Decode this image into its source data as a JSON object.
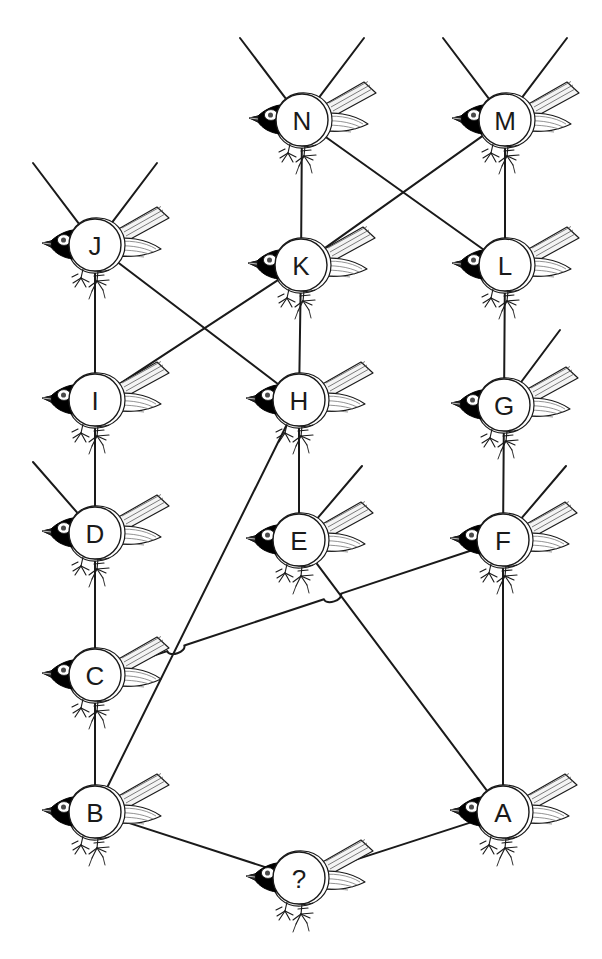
{
  "diagram": {
    "background_color": "#ffffff",
    "line_color": "#1a1a1a",
    "node_fill": "#ffffff",
    "node_stroke": "#1a1a1a",
    "label_color": "#1a1a1a",
    "bird_body_fill": "#ffffff",
    "bird_head_fill": "#000000",
    "bird_feather_fill": "#f2f2f2",
    "bird_outline": "#1a1a1a",
    "node_radius": 26
  },
  "nodes": [
    {
      "id": "N",
      "label": "N",
      "x": 302,
      "y": 120
    },
    {
      "id": "M",
      "label": "M",
      "x": 505,
      "y": 120
    },
    {
      "id": "J",
      "label": "J",
      "x": 95,
      "y": 245
    },
    {
      "id": "K",
      "label": "K",
      "x": 301,
      "y": 265
    },
    {
      "id": "L",
      "label": "L",
      "x": 505,
      "y": 265
    },
    {
      "id": "I",
      "label": "I",
      "x": 95,
      "y": 400
    },
    {
      "id": "H",
      "label": "H",
      "x": 299,
      "y": 400
    },
    {
      "id": "G",
      "label": "G",
      "x": 504,
      "y": 405
    },
    {
      "id": "D",
      "label": "D",
      "x": 95,
      "y": 533
    },
    {
      "id": "E",
      "label": "E",
      "x": 299,
      "y": 540
    },
    {
      "id": "F",
      "label": "F",
      "x": 503,
      "y": 540
    },
    {
      "id": "C",
      "label": "C",
      "x": 95,
      "y": 675
    },
    {
      "id": "B",
      "label": "B",
      "x": 95,
      "y": 812
    },
    {
      "id": "A",
      "label": "A",
      "x": 503,
      "y": 812
    },
    {
      "id": "Q",
      "label": "?",
      "x": 299,
      "y": 878
    }
  ],
  "edges": [
    {
      "from": "N",
      "to": "K",
      "kind": "straight"
    },
    {
      "from": "M",
      "to": "L",
      "kind": "straight"
    },
    {
      "from": "N",
      "to": "L",
      "kind": "straight"
    },
    {
      "from": "M",
      "to": "K",
      "kind": "straight"
    },
    {
      "from": "J",
      "to": "I",
      "kind": "straight"
    },
    {
      "from": "J",
      "to": "H",
      "kind": "straight"
    },
    {
      "from": "K",
      "to": "I",
      "kind": "straight"
    },
    {
      "from": "K",
      "to": "H",
      "kind": "straight"
    },
    {
      "from": "L",
      "to": "G",
      "kind": "straight"
    },
    {
      "from": "I",
      "to": "D",
      "kind": "straight"
    },
    {
      "from": "H",
      "to": "E",
      "kind": "straight"
    },
    {
      "from": "G",
      "to": "F",
      "kind": "straight"
    },
    {
      "from": "D",
      "to": "C",
      "kind": "straight"
    },
    {
      "from": "C",
      "to": "B",
      "kind": "straight"
    },
    {
      "from": "F",
      "to": "A",
      "kind": "straight"
    },
    {
      "from": "H",
      "to": "B",
      "kind": "straight"
    },
    {
      "from": "E",
      "to": "A",
      "kind": "straight"
    },
    {
      "from": "C",
      "to": "F",
      "kind": "hop-over"
    },
    {
      "from": "B",
      "to": "Q",
      "kind": "straight"
    },
    {
      "from": "Q",
      "to": "A",
      "kind": "straight"
    }
  ],
  "open_edges": [
    {
      "from": "N",
      "to_x": 240,
      "to_y": 38,
      "name": "n-up-left"
    },
    {
      "from": "N",
      "to_x": 364,
      "to_y": 38,
      "name": "n-up-right"
    },
    {
      "from": "M",
      "to_x": 443,
      "to_y": 38,
      "name": "m-up-left"
    },
    {
      "from": "M",
      "to_x": 567,
      "to_y": 38,
      "name": "m-up-right"
    },
    {
      "from": "J",
      "to_x": 33,
      "to_y": 163,
      "name": "j-up-left"
    },
    {
      "from": "J",
      "to_x": 157,
      "to_y": 163,
      "name": "j-up-right"
    },
    {
      "from": "G",
      "to_x": 560,
      "to_y": 330,
      "name": "g-up-right"
    },
    {
      "from": "D",
      "to_x": 33,
      "to_y": 462,
      "name": "d-up-left"
    },
    {
      "from": "E",
      "to_x": 362,
      "to_y": 466,
      "name": "e-up-right"
    },
    {
      "from": "F",
      "to_x": 566,
      "to_y": 466,
      "name": "f-up-right"
    }
  ],
  "crossings": [
    {
      "name": "j-h-over-k-i",
      "x": 199,
      "y": 331,
      "bridged": false
    },
    {
      "name": "n-l-over-m-k",
      "x": 403,
      "y": 193,
      "bridged": false
    },
    {
      "name": "c-f-over-h-b",
      "x": 178,
      "y": 655,
      "bridged": true
    },
    {
      "name": "c-f-over-e-a",
      "x": 334,
      "y": 601,
      "bridged": true
    }
  ]
}
